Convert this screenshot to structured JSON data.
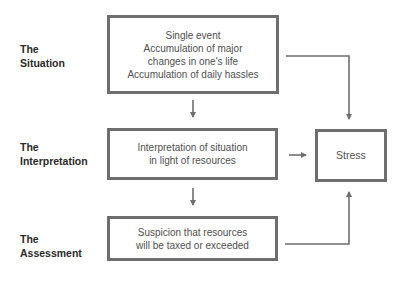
{
  "diagram": {
    "rows": [
      {
        "label_line1": "The",
        "label_line2": "Situation",
        "box_lines": [
          "Single event",
          "Accumulation of major",
          "changes in one's life",
          "Accumulation of daily hassles"
        ]
      },
      {
        "label_line1": "The",
        "label_line2": "Interpretation",
        "box_lines": [
          "Interpretation of situation",
          "in light of resources"
        ]
      },
      {
        "label_line1": "The",
        "label_line2": "Assessment",
        "box_lines": [
          "Suspicion that resources",
          "will be taxed or exceeded"
        ]
      }
    ],
    "outcome": {
      "label": "Stress"
    },
    "colors": {
      "border": "#6e6e6e",
      "arrow": "#6e6e6e",
      "text": "#4f4f4f",
      "label": "#2a2a2a"
    }
  }
}
